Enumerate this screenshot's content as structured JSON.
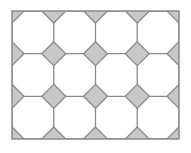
{
  "diagram": {
    "type": "octagon-square tiling",
    "columns": 4,
    "rows": 3,
    "colors": {
      "background": "#ffffff",
      "octagon_fill": "#ffffff",
      "square_fill": "#c8c8c8",
      "stroke": "#8a8a8a"
    }
  }
}
